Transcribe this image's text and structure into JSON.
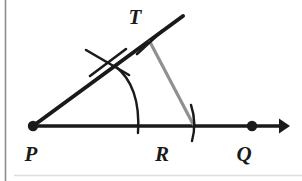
{
  "figure": {
    "kind": "geometry-construction-diagram",
    "background_color": "#ffffff",
    "ink_color": "#1a1a1a",
    "accent_color": "#909090",
    "frame": {
      "left_rule_color": "#8c8c8c",
      "bottom_rule_color": "#d8d8d8"
    },
    "labels": [
      {
        "id": "T",
        "text": "T",
        "x": 135,
        "y": 24
      },
      {
        "id": "P",
        "text": "P",
        "x": 31,
        "y": 161
      },
      {
        "id": "R",
        "text": "R",
        "x": 162,
        "y": 161
      },
      {
        "id": "Q",
        "text": "Q",
        "x": 244,
        "y": 161
      }
    ],
    "points": [
      {
        "id": "P",
        "x": 33,
        "y": 126,
        "radius": 5.2,
        "filled": true
      },
      {
        "id": "Q",
        "x": 252,
        "y": 126,
        "radius": 5.2,
        "filled": true
      }
    ],
    "rays": [
      {
        "id": "ray-PQ",
        "from": "P",
        "x1": 33,
        "y1": 126,
        "x2": 288,
        "y2": 126,
        "color": "#1a1a1a",
        "width": 3.4,
        "arrowhead": true
      },
      {
        "id": "ray-PT",
        "from": "P",
        "x1": 33,
        "y1": 126,
        "x2": 183,
        "y2": 16,
        "color": "#1a1a1a",
        "width": 4.0,
        "arrowhead": false
      }
    ],
    "segments": [
      {
        "id": "segment-TR",
        "x1": 150,
        "y1": 42,
        "x2": 193,
        "y2": 124,
        "color": "#909090",
        "width": 3.2
      }
    ],
    "arcs": [
      {
        "id": "arc-main-from-P",
        "note": "large compass arc centered at P crossing both rays",
        "path": "M 115 66 Q 141 86 138 133",
        "color": "#1a1a1a",
        "width": 2.4
      },
      {
        "id": "arc-tick-at-R",
        "note": "short compass arc crossing the base ray near R",
        "path": "M 191 105 Q 197 123 192 141",
        "color": "#1a1a1a",
        "width": 2.4
      }
    ],
    "tick_marks": [
      {
        "id": "tick-upper-ray-a",
        "x1": 86,
        "y1": 50,
        "x2": 129,
        "y2": 75,
        "color": "#1a1a1a",
        "width": 2.6
      },
      {
        "id": "tick-upper-ray-b",
        "x1": 90,
        "y1": 76,
        "x2": 126,
        "y2": 49,
        "color": "#1a1a1a",
        "width": 2.6
      },
      {
        "id": "tick-at-T",
        "x1": 137,
        "y1": 54,
        "x2": 162,
        "y2": 31,
        "color": "#1a1a1a",
        "width": 2.6
      }
    ]
  }
}
